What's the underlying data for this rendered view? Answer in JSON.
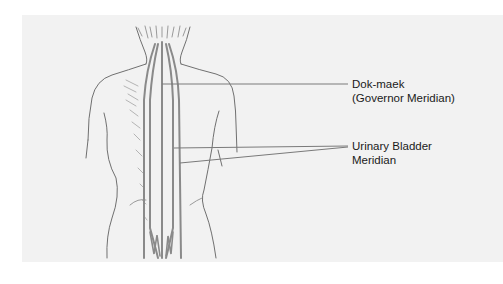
{
  "figure": {
    "colors": {
      "background": "#ffffff",
      "panel": "#f2f2f2",
      "outline": "#6e6e6e",
      "meridian": "#8a8a8a",
      "leader": "#7a7a7a",
      "text": "#1a1a1a"
    },
    "labels": {
      "governor": {
        "line1": "Dok-maek",
        "line2": "(Governor Meridian)"
      },
      "urinary_bladder": {
        "line1": "Urinary Bladder",
        "line2": "Meridian"
      }
    }
  }
}
